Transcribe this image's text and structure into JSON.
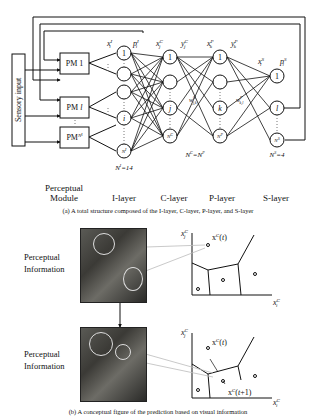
{
  "figure_a": {
    "caption": "(a) A total structure composed of the I-layer, C-layer, P-layer, and S-layer",
    "sensory_input_label": "Sensory input",
    "perceptual_modules": [
      "PM 1",
      "PM l",
      "PM N^I"
    ],
    "perceptual_module_label_line1": "Perceptual",
    "perceptual_module_label_line2": "Module",
    "layers": [
      {
        "name": "I-layer",
        "count_label": "N^I=14",
        "in_var": "x_i^I",
        "out_var": "p_i^I",
        "nodes": [
          "1",
          "",
          "",
          "i",
          "N^I"
        ]
      },
      {
        "name": "C-layer",
        "count_label": "N^C=N^P",
        "in_var": "x_j^C",
        "out_var": "y_j^C",
        "nodes": [
          "1",
          "",
          "j",
          "N^C"
        ]
      },
      {
        "name": "P-layer",
        "count_label": "",
        "in_var": "x_k^P",
        "out_var": "y_k^P",
        "nodes": [
          "1",
          "",
          "k",
          "N^P"
        ]
      },
      {
        "name": "S-layer",
        "count_label": "N^S=4",
        "in_var": "x_l^S",
        "out_var": "p_l^S",
        "nodes": [
          "1",
          "l",
          "N^S"
        ]
      }
    ],
    "weights": [
      "w^C_{j,k}",
      "w^P_{k,l}"
    ]
  },
  "figure_b": {
    "caption": "(b) A conceptual figure of the prediction based on visual information",
    "panels": [
      {
        "label_line1": "Perceptual",
        "label_line2": "Information",
        "y_axis": "x_j^C",
        "x_axis": "x_i^C",
        "point_labels": [
          "x^C(t)"
        ]
      },
      {
        "label_line1": "Perceptual",
        "label_line2": "Information",
        "y_axis": "x_j^C",
        "x_axis": "x_i^C",
        "point_labels": [
          "x^C(t)",
          "x^C(t+1)"
        ]
      }
    ]
  }
}
